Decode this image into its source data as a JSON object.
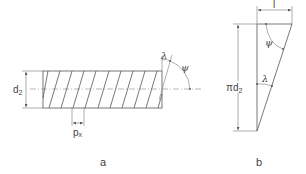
{
  "figure_a": {
    "caption": "a",
    "labels": {
      "diameter": "d",
      "diameter_sub": "2",
      "pitch": "p",
      "pitch_sub": "x",
      "lead_angle": "λ",
      "helix_angle": "ψ"
    },
    "helix_line_count": 10
  },
  "figure_b": {
    "caption": "b",
    "labels": {
      "circumference": "πd",
      "circumference_sub": "2",
      "lead": "l",
      "lead_angle": "λ",
      "helix_angle": "ψ"
    }
  },
  "colors": {
    "line": "#555555",
    "text": "#444444"
  }
}
